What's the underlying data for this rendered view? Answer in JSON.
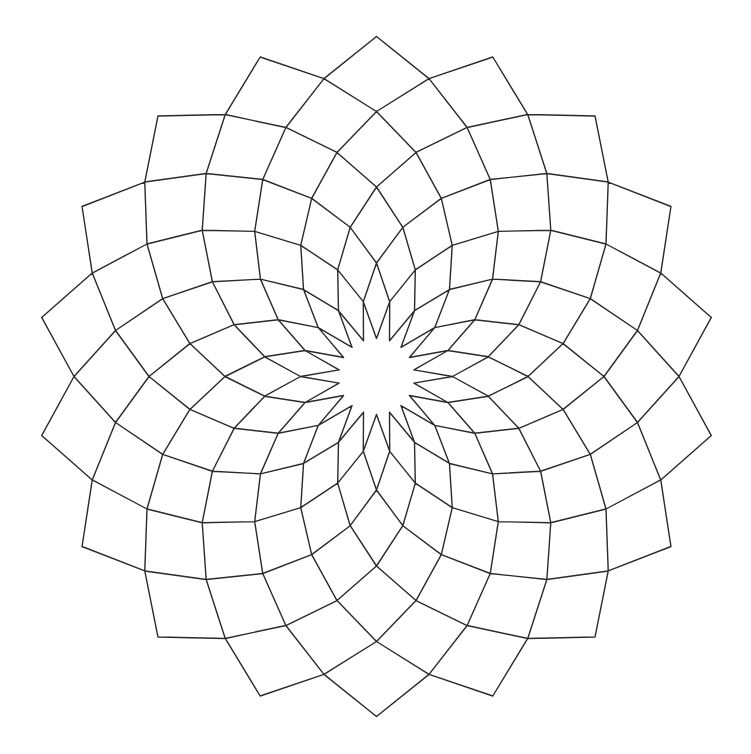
{
  "artwork": {
    "title": "",
    "description": "18-fold geometric rosette of rhombic cells with a white star at the center",
    "canvas": {
      "width": 751,
      "height": 754,
      "background": "#ffffff"
    },
    "stroke": {
      "color": "#2a2a2a",
      "width": 1.4
    },
    "pattern": {
      "symmetry": 18,
      "center": [
        376.5,
        376.5
      ],
      "outer_radius": 340,
      "ring_count": 9,
      "ring_radii": [
        340,
        302.5,
        265,
        227.5,
        189.5,
        151.5,
        113.5,
        76,
        38
      ],
      "start_angle_deg": -90,
      "angular_step_deg": 20,
      "odd_ring_offset_deg": 10,
      "center_star_points": 18,
      "center_star_inner_radius": 38,
      "center_star_outer_radius": 76
    }
  }
}
